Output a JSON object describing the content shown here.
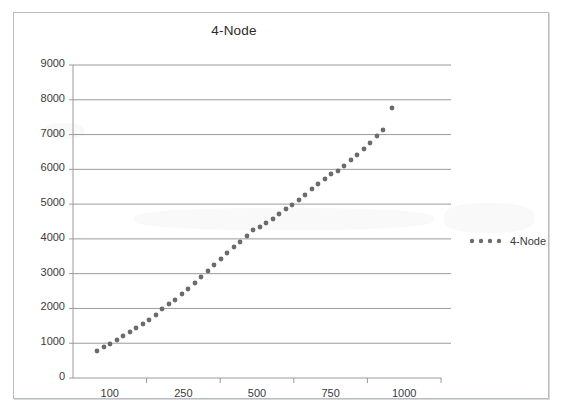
{
  "chart": {
    "title": "4-Node",
    "frame": {
      "border_color": "#b9bcc0",
      "background": "#ffffff"
    }
  },
  "legend": {
    "position": "right",
    "entries": [
      {
        "label": "4-Node",
        "marker": "dotted-line",
        "color": "#6b6b6b"
      }
    ]
  },
  "axes": {
    "y": {
      "ticks": [
        "0",
        "1000",
        "2000",
        "3000",
        "4000",
        "5000",
        "6000",
        "7000",
        "8000",
        "9000"
      ],
      "min": 0,
      "max": 9000,
      "gridlines": true
    },
    "x": {
      "ticks": [
        "100",
        "250",
        "500",
        "750",
        "1000"
      ],
      "gridlines": false
    }
  },
  "chart_data": {
    "type": "scatter",
    "title": "4-Node",
    "xlabel": "",
    "ylabel": "",
    "ylim": [
      0,
      9000
    ],
    "xlim": [
      50,
      1050
    ],
    "grid": true,
    "legend_position": "right",
    "series": [
      {
        "name": "4-Node",
        "color": "#6b6b6b",
        "marker": "dot",
        "x": [
          100,
          120,
          140,
          160,
          180,
          200,
          220,
          240,
          260,
          280,
          300,
          320,
          340,
          360,
          380,
          400,
          420,
          440,
          460,
          480,
          500,
          520,
          540,
          560,
          580,
          600,
          620,
          640,
          660,
          680,
          700,
          720,
          740,
          760,
          780,
          800,
          820,
          840,
          860,
          880,
          900,
          920,
          940,
          960,
          980,
          1000
        ],
        "y": [
          850,
          990,
          1090,
          1180,
          1270,
          1360,
          1450,
          1560,
          1680,
          1800,
          1960,
          2120,
          2210,
          2360,
          2520,
          2700,
          2870,
          3050,
          3210,
          3390,
          3560,
          3740,
          3890,
          4070,
          4230,
          4300,
          4410,
          4530,
          4680,
          4830,
          4960,
          5110,
          5260,
          5420,
          5560,
          5720,
          5870,
          5980,
          6120,
          6290,
          6430,
          6600,
          6780,
          6980,
          7160,
          8400
        ],
        "values": [
          850,
          990,
          1090,
          1180,
          1270,
          1360,
          1450,
          1560,
          1680,
          1800,
          1960,
          2120,
          2210,
          2360,
          2520,
          2700,
          2870,
          3050,
          3210,
          3390,
          3560,
          3740,
          3890,
          4070,
          4230,
          4300,
          4410,
          4530,
          4680,
          4830,
          4960,
          5110,
          5260,
          5420,
          5560,
          5720,
          5870,
          5980,
          6120,
          6290,
          6430,
          6600,
          6780,
          6980,
          7160,
          8400
        ]
      }
    ]
  },
  "plot_geometry": {
    "comment": "pixel positions used for faithful redraw, relative to chart frame",
    "left": 59,
    "right": 427,
    "top": 52,
    "bottom": 365,
    "points_px": [
      [
        83,
        338
      ],
      [
        90,
        334
      ],
      [
        96,
        331
      ],
      [
        103,
        327
      ],
      [
        109,
        323
      ],
      [
        116,
        319
      ],
      [
        122,
        315
      ],
      [
        129,
        311
      ],
      [
        135,
        307
      ],
      [
        142,
        302
      ],
      [
        148,
        296
      ],
      [
        155,
        291
      ],
      [
        161,
        287
      ],
      [
        168,
        281
      ],
      [
        174,
        276
      ],
      [
        181,
        270
      ],
      [
        187,
        264
      ],
      [
        194,
        258
      ],
      [
        200,
        252
      ],
      [
        207,
        246
      ],
      [
        213,
        240
      ],
      [
        220,
        234
      ],
      [
        226,
        229
      ],
      [
        233,
        223
      ],
      [
        239,
        217
      ],
      [
        246,
        214
      ],
      [
        252,
        210
      ],
      [
        259,
        206
      ],
      [
        265,
        201
      ],
      [
        272,
        196
      ],
      [
        278,
        192
      ],
      [
        285,
        187
      ],
      [
        291,
        182
      ],
      [
        298,
        176
      ],
      [
        304,
        171
      ],
      [
        311,
        166
      ],
      [
        317,
        161
      ],
      [
        324,
        158
      ],
      [
        330,
        153
      ],
      [
        337,
        147
      ],
      [
        343,
        142
      ],
      [
        350,
        136
      ],
      [
        356,
        130
      ],
      [
        363,
        123
      ],
      [
        369,
        117
      ],
      [
        378,
        95
      ]
    ]
  }
}
